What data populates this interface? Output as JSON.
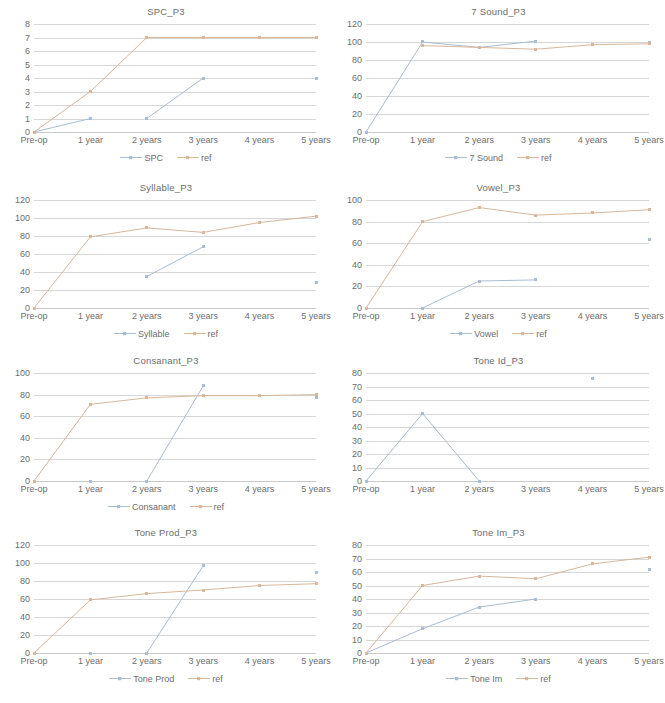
{
  "page": {
    "series_colors": {
      "primary": "#a9bdd4",
      "reference": "#d8b79a"
    },
    "x_categories": [
      "Pre-op",
      "1 year",
      "2 years",
      "3 years",
      "4 years",
      "5 years"
    ]
  },
  "chart_data": [
    {
      "id": "spc",
      "type": "line",
      "title": "SPC_P3",
      "xlabel": "",
      "ylabel": "",
      "grid": true,
      "legend_position": "bottom",
      "categories": [
        "Pre-op",
        "1 year",
        "2 years",
        "3 years",
        "4 years",
        "5 years"
      ],
      "ylim": [
        0,
        8
      ],
      "yticks": [
        0,
        1,
        2,
        3,
        4,
        5,
        6,
        7,
        8
      ],
      "series": [
        {
          "name": "SPC",
          "color": "#a9bdd4",
          "values": [
            0,
            1,
            1,
            4,
            null,
            4
          ],
          "connect": [
            [
              0,
              1
            ],
            [
              2,
              3
            ]
          ]
        },
        {
          "name": "ref",
          "color": "#d8b79a",
          "values": [
            0,
            3,
            7,
            7,
            7,
            7
          ],
          "connect": [
            [
              0,
              5
            ]
          ]
        }
      ]
    },
    {
      "id": "seven_sound",
      "type": "line",
      "title": "7 Sound_P3",
      "xlabel": "",
      "ylabel": "",
      "grid": true,
      "legend_position": "bottom",
      "categories": [
        "Pre-op",
        "1 year",
        "2 years",
        "3 years",
        "4 years",
        "5 years"
      ],
      "ylim": [
        0,
        120
      ],
      "yticks": [
        0,
        20,
        40,
        60,
        80,
        100,
        120
      ],
      "series": [
        {
          "name": "7 Sound",
          "color": "#a9bdd4",
          "values": [
            0,
            100,
            94,
            101,
            null,
            99
          ],
          "connect": [
            [
              0,
              3
            ],
            [
              5,
              5
            ]
          ]
        },
        {
          "name": "ref",
          "color": "#d8b79a",
          "values": [
            null,
            96,
            94,
            92,
            97,
            98
          ],
          "connect": [
            [
              1,
              5
            ]
          ]
        }
      ]
    },
    {
      "id": "syllable",
      "type": "line",
      "title": "Syllable_P3",
      "xlabel": "",
      "ylabel": "",
      "grid": true,
      "legend_position": "bottom",
      "categories": [
        "Pre-op",
        "1 year",
        "2 years",
        "3 years",
        "4 years",
        "5 years"
      ],
      "ylim": [
        0,
        120
      ],
      "yticks": [
        0,
        20,
        40,
        60,
        80,
        100,
        120
      ],
      "series": [
        {
          "name": "Syllable",
          "color": "#a9bdd4",
          "values": [
            null,
            null,
            35,
            68,
            null,
            28
          ],
          "connect": [
            [
              2,
              3
            ]
          ]
        },
        {
          "name": "ref",
          "color": "#d8b79a",
          "values": [
            0,
            79,
            89,
            84,
            95,
            102
          ],
          "connect": [
            [
              0,
              5
            ]
          ]
        }
      ]
    },
    {
      "id": "vowel",
      "type": "line",
      "title": "Vowel_P3",
      "xlabel": "",
      "ylabel": "",
      "grid": true,
      "legend_position": "bottom",
      "categories": [
        "Pre-op",
        "1 year",
        "2 years",
        "3 years",
        "4 years",
        "5 years"
      ],
      "ylim": [
        0,
        100
      ],
      "yticks": [
        0,
        20,
        40,
        60,
        80,
        100
      ],
      "series": [
        {
          "name": "Vowel",
          "color": "#a9bdd4",
          "values": [
            null,
            0,
            25,
            26,
            null,
            63
          ],
          "connect": [
            [
              1,
              3
            ]
          ]
        },
        {
          "name": "ref",
          "color": "#d8b79a",
          "values": [
            0,
            80,
            93,
            86,
            88,
            91
          ],
          "connect": [
            [
              0,
              5
            ]
          ]
        }
      ]
    },
    {
      "id": "consonant",
      "type": "line",
      "title": "Consanant_P3",
      "xlabel": "",
      "ylabel": "",
      "grid": true,
      "legend_position": "bottom",
      "categories": [
        "Pre-op",
        "1 year",
        "2 years",
        "3 years",
        "4 years",
        "5 years"
      ],
      "ylim": [
        0,
        100
      ],
      "yticks": [
        0,
        20,
        40,
        60,
        80,
        100
      ],
      "series": [
        {
          "name": "Consanant",
          "color": "#a9bdd4",
          "values": [
            null,
            0,
            0,
            88,
            null,
            77
          ],
          "connect": [
            [
              2,
              3
            ]
          ]
        },
        {
          "name": "ref",
          "color": "#d8b79a",
          "values": [
            0,
            71,
            77,
            79,
            79,
            80
          ],
          "connect": [
            [
              0,
              5
            ]
          ]
        }
      ]
    },
    {
      "id": "tone_id",
      "type": "line",
      "title": "Tone Id_P3",
      "xlabel": "",
      "ylabel": "",
      "grid": true,
      "legend_position": "none",
      "categories": [
        "Pre-op",
        "1 year",
        "2 years",
        "3 years",
        "4 years",
        "5 years"
      ],
      "ylim": [
        0,
        80
      ],
      "yticks": [
        0,
        10,
        20,
        30,
        40,
        50,
        60,
        70,
        80
      ],
      "series": [
        {
          "name": "Tone Id",
          "color": "#a9bdd4",
          "values": [
            0,
            50,
            0,
            null,
            76,
            null
          ],
          "connect": [
            [
              0,
              2
            ]
          ]
        }
      ]
    },
    {
      "id": "tone_prod",
      "type": "line",
      "title": "Tone Prod_P3",
      "xlabel": "",
      "ylabel": "",
      "grid": true,
      "legend_position": "bottom",
      "categories": [
        "Pre-op",
        "1 year",
        "2 years",
        "3 years",
        "4 years",
        "5 years"
      ],
      "ylim": [
        0,
        120
      ],
      "yticks": [
        0,
        20,
        40,
        60,
        80,
        100,
        120
      ],
      "series": [
        {
          "name": "Tone Prod",
          "color": "#a9bdd4",
          "values": [
            null,
            0,
            0,
            97,
            null,
            90
          ],
          "connect": [
            [
              2,
              3
            ]
          ]
        },
        {
          "name": "ref",
          "color": "#d8b79a",
          "values": [
            0,
            59,
            66,
            70,
            75,
            77
          ],
          "connect": [
            [
              0,
              5
            ]
          ]
        }
      ]
    },
    {
      "id": "tone_im",
      "type": "line",
      "title": "Tone Im_P3",
      "xlabel": "",
      "ylabel": "",
      "grid": true,
      "legend_position": "bottom",
      "categories": [
        "Pre-op",
        "1 year",
        "2 years",
        "3 years",
        "4 years",
        "5 years"
      ],
      "ylim": [
        0,
        80
      ],
      "yticks": [
        0,
        10,
        20,
        30,
        40,
        50,
        60,
        70,
        80
      ],
      "series": [
        {
          "name": "Tone Im",
          "color": "#a9bdd4",
          "values": [
            0,
            18,
            34,
            40,
            null,
            62
          ],
          "connect": [
            [
              0,
              3
            ]
          ]
        },
        {
          "name": "ref",
          "color": "#d8b79a",
          "values": [
            0,
            50,
            57,
            55,
            66,
            71
          ],
          "connect": [
            [
              0,
              5
            ]
          ]
        }
      ]
    }
  ]
}
